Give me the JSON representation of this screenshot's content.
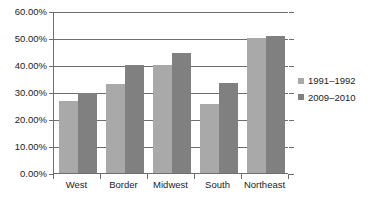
{
  "chart_data": {
    "type": "bar",
    "title": "",
    "subtitle": "",
    "xlabel": "",
    "ylabel": "",
    "categories": [
      "West",
      "Border",
      "Midwest",
      "South",
      "Northeast"
    ],
    "series": [
      {
        "name": "1991–1992",
        "color": "#a9a9a9",
        "values": [
          26.5,
          33.0,
          40.0,
          25.7,
          50.0
        ]
      },
      {
        "name": "2009–2010",
        "color": "#808080",
        "values": [
          29.7,
          40.0,
          44.3,
          33.5,
          50.8
        ]
      }
    ],
    "ylim": [
      0,
      60
    ],
    "ytick_values": [
      0,
      10,
      20,
      30,
      40,
      50,
      60
    ],
    "ytick_labels": [
      "0.00%",
      "10.00%",
      "20.00%",
      "30.00%",
      "40.00%",
      "50.00%",
      "60.00%"
    ],
    "value_format": "percent",
    "grid": true,
    "grid_axis": "y",
    "legend_position": "right",
    "legend_entries": [
      "1991–1992",
      "2009–2010"
    ]
  }
}
